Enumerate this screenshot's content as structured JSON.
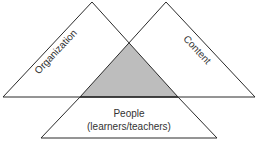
{
  "diagram": {
    "type": "overlapping-triangles",
    "colors": {
      "stroke": "#2a2a2a",
      "fill": "#ffffff",
      "overlap_fill": "#bdbdbd",
      "text": "#333333"
    },
    "triangles": [
      {
        "id": "organization",
        "label": "Organization"
      },
      {
        "id": "content",
        "label": "Content"
      },
      {
        "id": "people",
        "label": "People",
        "sublabel": "(learners/teachers)"
      }
    ],
    "overlap": {
      "description": "shaded intersection of Organization, Content and People"
    }
  }
}
